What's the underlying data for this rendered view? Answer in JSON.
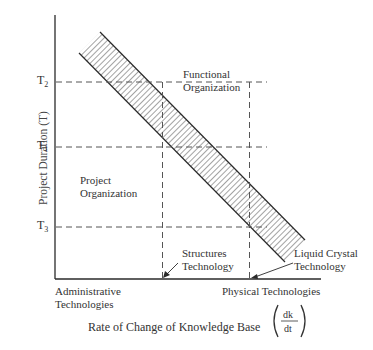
{
  "diagram": {
    "y_axis_label": "Project Duration (T)",
    "x_axis_label": "Rate of Change of Knowledge Base",
    "x_axis_fraction": {
      "numerator": "dk",
      "denominator": "dt"
    },
    "y_ticks": [
      {
        "base": "T",
        "sub": "2"
      },
      {
        "base": "T",
        "sub": "1"
      },
      {
        "base": "T",
        "sub": "3"
      }
    ],
    "x_left_label": [
      "Administrative",
      "Technologies"
    ],
    "x_right_label": "Physical Technologies",
    "regions": {
      "functional": [
        "Functional",
        "Organization"
      ],
      "project": [
        "Project",
        "Organization"
      ]
    },
    "callouts": {
      "structures": [
        "Structures",
        "Technology"
      ],
      "liquid_crystal": [
        "Liquid Crystal",
        "Technology"
      ]
    },
    "colors": {
      "line": "#2a2a2a",
      "dash": "#555555",
      "hatch": "#333333"
    }
  }
}
